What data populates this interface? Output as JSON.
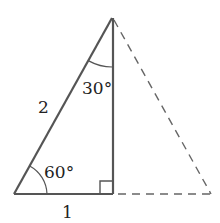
{
  "figure": {
    "type": "30-60-90 triangle with reflected equilateral half",
    "colors": {
      "solid_line": "#555555",
      "dashed_line": "#666666",
      "text": "#222222"
    },
    "vertices": {
      "apex": [
        112,
        18
      ],
      "bottom_left": [
        14,
        194
      ],
      "right_angle": [
        113,
        194
      ],
      "dashed_corner": [
        211,
        194
      ]
    },
    "labels": {
      "hypotenuse": "2",
      "base": "1",
      "top_angle": "30°",
      "bottom_angle": "60°"
    },
    "right_angle_marker": true,
    "dashed_reflection": true
  }
}
